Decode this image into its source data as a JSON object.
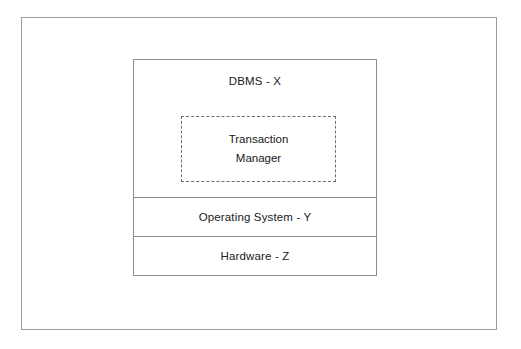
{
  "figure": {
    "frame_color": "#9a9a9a",
    "background_color": "#ffffff",
    "box_border_color": "#8d8d8d",
    "dashed_border_color": "#6d6d6d",
    "text_color": "#202020"
  },
  "diagram": {
    "type": "layered-stack",
    "layers": [
      {
        "id": "dbms",
        "label": "DBMS - X",
        "border_style": "solid",
        "contains": [
          "transaction-manager"
        ]
      },
      {
        "id": "operating-system",
        "label": "Operating System - Y",
        "border_style": "solid",
        "contains": []
      },
      {
        "id": "hardware",
        "label": "Hardware - Z",
        "border_style": "solid",
        "contains": []
      }
    ],
    "components": [
      {
        "id": "transaction-manager",
        "label_line_1": "Transaction",
        "label_line_2": "Manager",
        "border_style": "dashed",
        "parent": "dbms"
      }
    ]
  }
}
